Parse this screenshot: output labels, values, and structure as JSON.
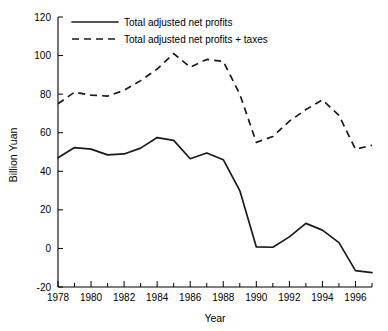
{
  "chart_data": {
    "type": "line",
    "title": "",
    "subtitle": "",
    "xlabel": "Year",
    "ylabel": "Billion Yuan",
    "xlim": [
      1978,
      1997
    ],
    "ylim": [
      -20,
      120
    ],
    "ytick_step": 20,
    "xtick_step": 2,
    "xtick_minor_step": 1,
    "grid": false,
    "legend_position": "top-left-inside",
    "yticks": [
      -20,
      0,
      20,
      40,
      60,
      80,
      100,
      120
    ],
    "ytick_labels": [
      "-20",
      "0",
      "20",
      "40",
      "60",
      "80",
      "100",
      "120"
    ],
    "xticks": [
      1978,
      1980,
      1982,
      1984,
      1986,
      1988,
      1990,
      1992,
      1994,
      1996
    ],
    "xtick_labels": [
      "1978",
      "1980",
      "1982",
      "1984",
      "1986",
      "1988",
      "1990",
      "1992",
      "1994",
      "1996"
    ],
    "x": [
      1978,
      1979,
      1980,
      1981,
      1982,
      1983,
      1984,
      1985,
      1986,
      1987,
      1988,
      1989,
      1990,
      1991,
      1992,
      1993,
      1994,
      1995,
      1996,
      1997
    ],
    "series": [
      {
        "name": "Total adjusted net profits",
        "style": "solid",
        "color": "#1a1a1a",
        "values": [
          47,
          52.3,
          51.5,
          48.5,
          49,
          52,
          57.5,
          56,
          46.5,
          49.5,
          46,
          30,
          0.8,
          0.6,
          6,
          13,
          9.5,
          3,
          -11.5,
          -12.5
        ]
      },
      {
        "name": "Total adjusted net profits + taxes",
        "style": "dashed",
        "color": "#1a1a1a",
        "values": [
          75,
          81,
          79.5,
          79,
          82,
          87,
          93,
          101,
          94,
          98,
          97,
          80,
          55,
          58,
          66,
          72,
          77,
          69,
          51.5,
          53.5
        ]
      }
    ],
    "legend": [
      {
        "label": "Total adjusted net profits",
        "style": "solid"
      },
      {
        "label": "Total adjusted net profits + taxes",
        "style": "dashed"
      }
    ]
  }
}
